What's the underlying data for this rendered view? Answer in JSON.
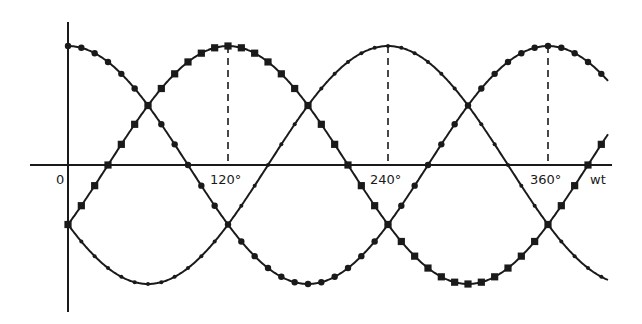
{
  "chart_data": {
    "type": "line",
    "title": "",
    "xlabel": "wt",
    "ylabel": "",
    "x_unit": "degrees",
    "x_ticks": [
      {
        "value": 0,
        "label": "0"
      },
      {
        "value": 120,
        "label": "120°"
      },
      {
        "value": 240,
        "label": "240°"
      },
      {
        "value": 360,
        "label": "360°"
      }
    ],
    "xlim": [
      0,
      405
    ],
    "ylim": [
      -1,
      1
    ],
    "grid": false,
    "legend": null,
    "dashed_markers_at": [
      120,
      240,
      360
    ],
    "series": [
      {
        "name": "phase-a",
        "marker": "circle",
        "function": "cos(wt)",
        "phase_deg": 0,
        "x": [
          0,
          30,
          60,
          90,
          120,
          150,
          180,
          210,
          240,
          270,
          300,
          330,
          360,
          390,
          405
        ],
        "values": [
          1.0,
          0.87,
          0.5,
          0.0,
          -0.5,
          -0.87,
          -1.0,
          -0.87,
          -0.5,
          0.0,
          0.5,
          0.87,
          1.0,
          0.87,
          0.71
        ]
      },
      {
        "name": "phase-b",
        "marker": "square",
        "function": "cos(wt-120)",
        "phase_deg": 120,
        "x": [
          0,
          30,
          60,
          90,
          120,
          150,
          180,
          210,
          240,
          270,
          300,
          330,
          360,
          390,
          405
        ],
        "values": [
          -0.5,
          0.0,
          0.5,
          0.87,
          1.0,
          0.87,
          0.5,
          0.0,
          -0.5,
          -0.87,
          -1.0,
          -0.87,
          -0.5,
          0.0,
          0.26
        ]
      },
      {
        "name": "phase-c",
        "marker": "tick",
        "function": "cos(wt-240)",
        "phase_deg": 240,
        "x": [
          0,
          30,
          60,
          90,
          120,
          150,
          180,
          210,
          240,
          270,
          300,
          330,
          360,
          390,
          405
        ],
        "values": [
          -0.5,
          -0.87,
          -1.0,
          -0.87,
          -0.5,
          0.0,
          0.5,
          0.87,
          1.0,
          0.87,
          0.5,
          0.0,
          -0.5,
          -0.87,
          -0.97
        ]
      }
    ]
  },
  "axis": {
    "origin_label": "0",
    "x_axis_label": "wt",
    "tick_labels": [
      "120°",
      "240°",
      "360°"
    ]
  },
  "layout": {
    "origin_x": 68,
    "axis_y": 165,
    "px_per_deg": 1.3333,
    "amplitude_px": 119,
    "line_color": "#1a1a1a"
  }
}
